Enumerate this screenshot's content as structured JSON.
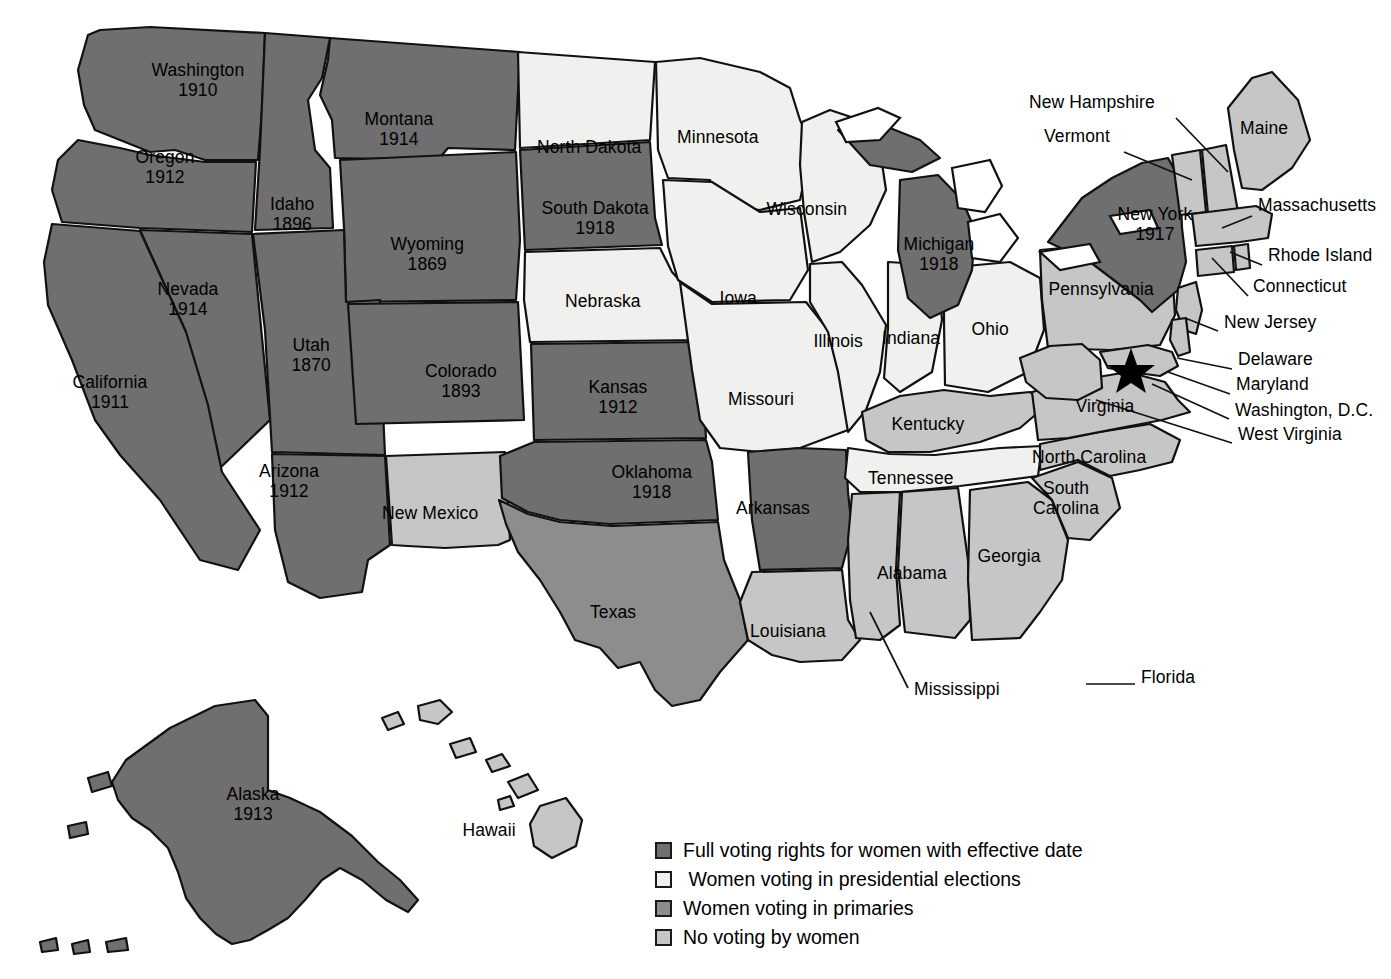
{
  "map": {
    "title": "Women's Voting Rights in the United States",
    "categories": {
      "full": {
        "label": "Full voting rights for women with effective date",
        "color": "#6f6f6f"
      },
      "presidential": {
        "label": " Women voting in presidential elections",
        "color": "#f0f0ee"
      },
      "primaries": {
        "label": "Women voting in primaries",
        "color": "#8d8d8d"
      },
      "none": {
        "label": "No voting by women",
        "color": "#c6c6c6"
      }
    },
    "legend": [
      {
        "key": "full",
        "label": "Full voting rights for women with effective date",
        "color": "#6f6f6f"
      },
      {
        "key": "presidential",
        "label": " Women voting in presidential elections",
        "color": "#f0f0ee"
      },
      {
        "key": "primaries",
        "label": "Women voting in primaries",
        "color": "#8d8d8d"
      },
      {
        "key": "none",
        "label": "No voting by women",
        "color": "#c6c6c6"
      }
    ],
    "dc_marker": "star",
    "states": [
      {
        "name": "Washington",
        "year": "1910",
        "category": "full",
        "label_x": 198,
        "label_y": 80
      },
      {
        "name": "Oregon",
        "year": "1912",
        "category": "full",
        "label_x": 165,
        "label_y": 167
      },
      {
        "name": "Montana",
        "year": "1914",
        "category": "full",
        "label_x": 399,
        "label_y": 129
      },
      {
        "name": "Idaho",
        "year": "1896",
        "category": "full",
        "label_x": 292,
        "label_y": 214
      },
      {
        "name": "Wyoming",
        "year": "1869",
        "category": "full",
        "label_x": 427,
        "label_y": 254
      },
      {
        "name": "Nevada",
        "year": "1914",
        "category": "full",
        "label_x": 188,
        "label_y": 299
      },
      {
        "name": "Utah",
        "year": "1870",
        "category": "full",
        "label_x": 311,
        "label_y": 355
      },
      {
        "name": "California",
        "year": "1911",
        "category": "full",
        "label_x": 110,
        "label_y": 392
      },
      {
        "name": "Colorado",
        "year": "1893",
        "category": "full",
        "label_x": 461,
        "label_y": 381
      },
      {
        "name": "Arizona",
        "year": "1912",
        "category": "full",
        "label_x": 289,
        "label_y": 481
      },
      {
        "name": "New Mexico",
        "year": "",
        "category": "none",
        "label_x": 430,
        "label_y": 513
      },
      {
        "name": "North Dakota",
        "year": "",
        "category": "presidential",
        "label_x": 589,
        "label_y": 147
      },
      {
        "name": "South Dakota",
        "year": "1918",
        "category": "full",
        "label_x": 595,
        "label_y": 218
      },
      {
        "name": "Nebraska",
        "year": "",
        "category": "presidential",
        "label_x": 603,
        "label_y": 301
      },
      {
        "name": "Kansas",
        "year": "1912",
        "category": "full",
        "label_x": 618,
        "label_y": 397
      },
      {
        "name": "Oklahoma",
        "year": "1918",
        "category": "full",
        "label_x": 652,
        "label_y": 482
      },
      {
        "name": "Texas",
        "year": "",
        "category": "primaries",
        "label_x": 613,
        "label_y": 612
      },
      {
        "name": "Minnesota",
        "year": "",
        "category": "presidential",
        "label_x": 718,
        "label_y": 137
      },
      {
        "name": "Wisconsin",
        "year": "",
        "category": "presidential",
        "label_x": 807,
        "label_y": 209
      },
      {
        "name": "Iowa",
        "year": "",
        "category": "presidential",
        "label_x": 738,
        "label_y": 298
      },
      {
        "name": "Missouri",
        "year": "",
        "category": "presidential",
        "label_x": 761,
        "label_y": 399
      },
      {
        "name": "Illinois",
        "year": "",
        "category": "presidential",
        "label_x": 838,
        "label_y": 341
      },
      {
        "name": "Indiana",
        "year": "",
        "category": "presidential",
        "label_x": 911,
        "label_y": 338
      },
      {
        "name": "Ohio",
        "year": "",
        "category": "presidential",
        "label_x": 990,
        "label_y": 329
      },
      {
        "name": "Michigan",
        "year": "1918",
        "category": "full",
        "label_x": 939,
        "label_y": 254
      },
      {
        "name": "Arkansas",
        "year": "",
        "category": "full",
        "label_x": 773,
        "label_y": 508
      },
      {
        "name": "Louisiana",
        "year": "",
        "category": "none",
        "label_x": 788,
        "label_y": 631
      },
      {
        "name": "Kentucky",
        "year": "",
        "category": "none",
        "label_x": 928,
        "label_y": 424
      },
      {
        "name": "Tennessee",
        "year": "",
        "category": "presidential",
        "label_x": 911,
        "label_y": 478
      },
      {
        "name": "Alabama",
        "year": "",
        "category": "none",
        "label_x": 912,
        "label_y": 573
      },
      {
        "name": "Georgia",
        "year": "",
        "category": "none",
        "label_x": 1009,
        "label_y": 556
      },
      {
        "name": "South\nCarolina",
        "year": "",
        "category": "none",
        "label_x": 1066,
        "label_y": 498
      },
      {
        "name": "North Carolina",
        "year": "",
        "category": "none",
        "label_x": 1089,
        "label_y": 457
      },
      {
        "name": "Virginia",
        "year": "",
        "category": "none",
        "label_x": 1105,
        "label_y": 406
      },
      {
        "name": "Pennsylvania",
        "year": "",
        "category": "none",
        "label_x": 1101,
        "label_y": 289
      },
      {
        "name": "New York",
        "year": "1917",
        "category": "full",
        "label_x": 1155,
        "label_y": 224
      },
      {
        "name": "Alaska",
        "year": "1913",
        "category": "full",
        "label_x": 253,
        "label_y": 804
      },
      {
        "name": "Hawaii",
        "year": "",
        "category": "none",
        "label_x": 489,
        "label_y": 830
      }
    ],
    "callouts": [
      {
        "name": "New Hampshire",
        "x": 1029,
        "y": 103,
        "anchor": "left",
        "line": [
          [
            1176,
            118
          ],
          [
            1228,
            172
          ]
        ]
      },
      {
        "name": "Vermont",
        "x": 1044,
        "y": 137,
        "anchor": "left",
        "line": [
          [
            1124,
            152
          ],
          [
            1192,
            180
          ]
        ]
      },
      {
        "name": "Maine",
        "x": 1240,
        "y": 129,
        "anchor": "left",
        "line": null
      },
      {
        "name": "Massachusetts",
        "x": 1258,
        "y": 206,
        "anchor": "left",
        "line": [
          [
            1252,
            216
          ],
          [
            1222,
            228
          ]
        ]
      },
      {
        "name": "Rhode Island",
        "x": 1268,
        "y": 256,
        "anchor": "left",
        "line": [
          [
            1262,
            265
          ],
          [
            1230,
            252
          ]
        ]
      },
      {
        "name": "Connecticut",
        "x": 1253,
        "y": 287,
        "anchor": "left",
        "line": [
          [
            1248,
            296
          ],
          [
            1212,
            258
          ]
        ]
      },
      {
        "name": "New Jersey",
        "x": 1224,
        "y": 323,
        "anchor": "left",
        "line": [
          [
            1218,
            331
          ],
          [
            1185,
            318
          ]
        ]
      },
      {
        "name": "Delaware",
        "x": 1238,
        "y": 360,
        "anchor": "left",
        "line": [
          [
            1232,
            369
          ],
          [
            1177,
            358
          ]
        ]
      },
      {
        "name": "Maryland",
        "x": 1236,
        "y": 385,
        "anchor": "left",
        "line": [
          [
            1230,
            394
          ],
          [
            1168,
            372
          ]
        ]
      },
      {
        "name": "Washington, D.C.",
        "x": 1235,
        "y": 411,
        "anchor": "left",
        "line": [
          [
            1229,
            419
          ],
          [
            1152,
            384
          ]
        ]
      },
      {
        "name": "West Virginia",
        "x": 1238,
        "y": 435,
        "anchor": "left",
        "line": [
          [
            1232,
            443
          ],
          [
            1096,
            400
          ]
        ]
      },
      {
        "name": "Mississippi",
        "x": 914,
        "y": 690,
        "anchor": "left",
        "line": [
          [
            908,
            688
          ],
          [
            870,
            612
          ]
        ]
      },
      {
        "name": "Florida",
        "x": 1141,
        "y": 678,
        "anchor": "left",
        "line": [
          [
            1135,
            684
          ],
          [
            1086,
            684
          ]
        ]
      }
    ]
  }
}
